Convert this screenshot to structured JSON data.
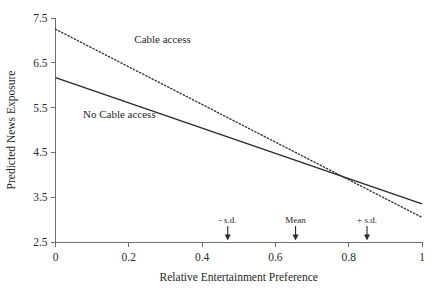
{
  "chart_data": {
    "type": "line",
    "title": "",
    "xlabel": "Relative Entertainment Preference",
    "ylabel": "Predicted News Exposure",
    "xlim": [
      0,
      1
    ],
    "ylim": [
      2.5,
      7.5
    ],
    "grid": false,
    "legend_position": "inline-on-lines",
    "xticks": [
      0,
      0.2,
      0.4,
      0.6,
      0.8,
      1
    ],
    "xtick_labels": [
      "0",
      "0.2",
      "0.4",
      "0.6",
      "0.8",
      "1"
    ],
    "yticks": [
      2.5,
      3.5,
      4.5,
      5.5,
      6.5,
      7.5
    ],
    "ytick_labels": [
      "2.5",
      "3.5",
      "4.5",
      "5.5",
      "6.5",
      "7.5"
    ],
    "series": [
      {
        "name": "Cable access",
        "style": "dotted",
        "color": "#3a3a3a",
        "x": [
          0,
          1
        ],
        "values": [
          7.25,
          3.05
        ],
        "label_text": "Cable access",
        "label_x": 0.215,
        "label_y": 6.95
      },
      {
        "name": "No Cable access",
        "style": "solid",
        "color": "#2a2a2a",
        "x": [
          0,
          1
        ],
        "values": [
          6.17,
          3.35
        ],
        "label_text": "No Cable access",
        "label_x": 0.075,
        "label_y": 5.27
      }
    ],
    "annotations": [
      {
        "name": "minus-sd",
        "text": "- s.d.",
        "x": 0.47,
        "y": 2.5
      },
      {
        "name": "mean",
        "text": "Mean",
        "x": 0.655,
        "y": 2.5
      },
      {
        "name": "plus-sd",
        "text": "+ s.d.",
        "x": 0.85,
        "y": 2.5
      }
    ]
  }
}
